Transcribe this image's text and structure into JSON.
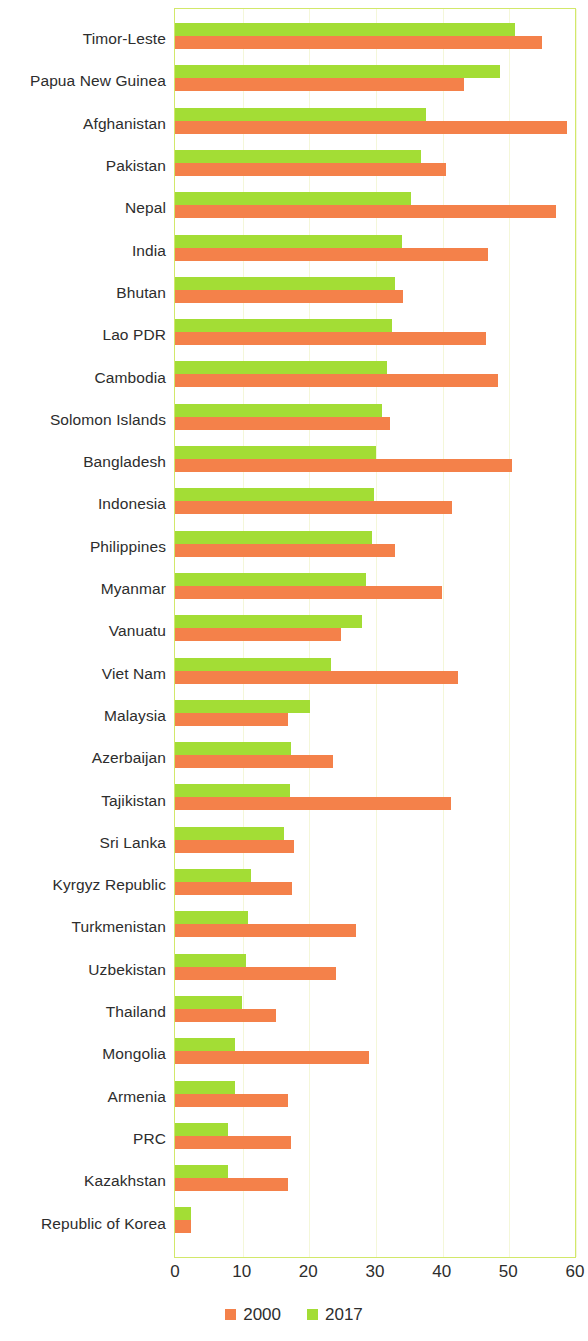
{
  "chart_data": {
    "type": "bar",
    "orientation": "horizontal",
    "title": "",
    "subtitle": "",
    "xlabel": "",
    "ylabel": "",
    "xlim": [
      0,
      60
    ],
    "xticks": [
      0,
      10,
      20,
      30,
      40,
      50,
      60
    ],
    "xtick_labels": [
      "0",
      "10",
      "20",
      "30",
      "40",
      "50",
      "60"
    ],
    "grid": true,
    "grid_axis": "x",
    "legend_position": "bottom-center",
    "categories": [
      "Timor-Leste",
      "Papua New Guinea",
      "Afghanistan",
      "Pakistan",
      "Nepal",
      "India",
      "Bhutan",
      "Lao PDR",
      "Cambodia",
      "Solomon Islands",
      "Bangladesh",
      "Indonesia",
      "Philippines",
      "Myanmar",
      "Vanuatu",
      "Viet Nam",
      "Malaysia",
      "Azerbaijan",
      "Tajikistan",
      "Sri Lanka",
      "Kyrgyz Republic",
      "Turkmenistan",
      "Uzbekistan",
      "Thailand",
      "Mongolia",
      "Armenia",
      "PRC",
      "Kazakhstan",
      "Republic of Korea"
    ],
    "series": [
      {
        "name": "2000",
        "color": "#f4814a",
        "values": [
          55.0,
          43.4,
          58.8,
          40.7,
          57.1,
          47.0,
          34.2,
          46.6,
          48.5,
          32.3,
          50.5,
          41.5,
          33.0,
          40.1,
          24.9,
          42.5,
          16.9,
          23.7,
          41.4,
          17.9,
          17.5,
          27.2,
          24.2,
          15.2,
          29.1,
          16.9,
          17.4,
          16.9,
          2.4
        ]
      },
      {
        "name": "2017",
        "color": "#a3dd35",
        "values": [
          51.0,
          48.8,
          37.6,
          36.9,
          35.4,
          34.1,
          33.0,
          32.5,
          31.8,
          31.0,
          30.1,
          29.9,
          29.6,
          28.7,
          28.0,
          23.4,
          20.3,
          17.4,
          17.3,
          16.4,
          11.4,
          11.0,
          10.6,
          10.0,
          9.0,
          9.0,
          7.9,
          7.9,
          2.4
        ]
      }
    ]
  },
  "legend": {
    "items": [
      {
        "label": "2000",
        "color": "#f4814a",
        "swatch_name": "legend-swatch-2000"
      },
      {
        "label": "2017",
        "color": "#a3dd35",
        "swatch_name": "legend-swatch-2017"
      }
    ]
  },
  "axis": {
    "tick_labels": [
      "0",
      "10",
      "20",
      "30",
      "40",
      "50",
      "60"
    ]
  },
  "theme": {
    "plot_border_color": "#d2e86a",
    "gridline_color": "#f4f7d9",
    "background": "#ffffff",
    "text_color": "#2d2d2d",
    "series_2000_color": "#f4814a",
    "series_2017_color": "#a3dd35"
  }
}
